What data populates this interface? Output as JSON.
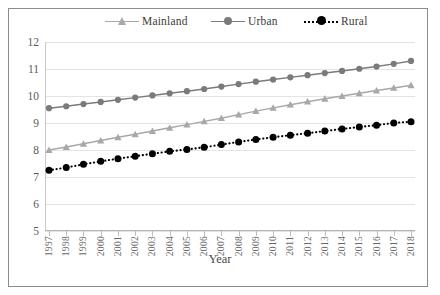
{
  "chart_data": {
    "type": "line",
    "title": "",
    "xlabel": "Year",
    "ylabel": "",
    "ylim": [
      5,
      12
    ],
    "ytick_step": 1,
    "yticks": [
      "12",
      "11",
      "10",
      "9",
      "8",
      "7",
      "6",
      "5"
    ],
    "grid": true,
    "legend_position": "top",
    "categories": [
      "1997",
      "1998",
      "1999",
      "2000",
      "2001",
      "2002",
      "2003",
      "2004",
      "2005",
      "2006",
      "2007",
      "2008",
      "2009",
      "2010",
      "2011",
      "2012",
      "2013",
      "2014",
      "2015",
      "2016",
      "2017",
      "2018"
    ],
    "x": [
      1997,
      1998,
      1999,
      2000,
      2001,
      2002,
      2003,
      2004,
      2005,
      2006,
      2007,
      2008,
      2009,
      2010,
      2011,
      2012,
      2013,
      2014,
      2015,
      2016,
      2017,
      2018
    ],
    "series": [
      {
        "name": "Mainland",
        "color": "#a8a8a8",
        "marker": "triangle",
        "linestyle": "solid",
        "values": [
          8.0,
          8.11,
          8.23,
          8.35,
          8.47,
          8.58,
          8.7,
          8.82,
          8.94,
          9.06,
          9.18,
          9.31,
          9.44,
          9.56,
          9.68,
          9.79,
          9.9,
          10.0,
          10.1,
          10.2,
          10.3,
          10.4
        ]
      },
      {
        "name": "Urban",
        "color": "#7a7a7a",
        "marker": "circle",
        "linestyle": "solid",
        "values": [
          9.55,
          9.62,
          9.7,
          9.78,
          9.86,
          9.94,
          10.02,
          10.1,
          10.18,
          10.26,
          10.35,
          10.44,
          10.53,
          10.61,
          10.69,
          10.77,
          10.85,
          10.93,
          11.01,
          11.09,
          11.19,
          11.3
        ]
      },
      {
        "name": "Rural",
        "color": "#000000",
        "marker": "circle",
        "linestyle": "dotted",
        "values": [
          7.25,
          7.35,
          7.47,
          7.58,
          7.68,
          7.77,
          7.86,
          7.95,
          8.02,
          8.1,
          8.2,
          8.3,
          8.39,
          8.47,
          8.55,
          8.62,
          8.7,
          8.78,
          8.85,
          8.92,
          9.0,
          9.05
        ]
      }
    ]
  },
  "legend": {
    "items": [
      {
        "label": "Mainland"
      },
      {
        "label": "Urban"
      },
      {
        "label": "Rural"
      }
    ]
  },
  "axis": {
    "x_title": "Year"
  }
}
